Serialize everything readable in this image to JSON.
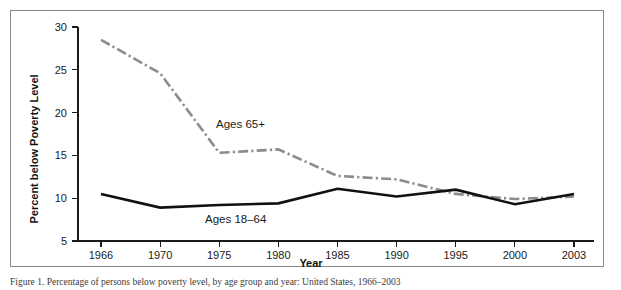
{
  "figure": {
    "background_color": "#ffffff",
    "border_color": "#8a8a8a",
    "caption_partial": "Figure 1. Percentage of persons below poverty level, by age group and year: United States, 1966–2003"
  },
  "chart_data": {
    "type": "line",
    "title": "",
    "xlabel": "Year",
    "ylabel": "Percent below Poverty Level",
    "categories": [
      "1966",
      "1970",
      "1975",
      "1980",
      "1985",
      "1990",
      "1995",
      "2000",
      "2003"
    ],
    "x": [
      1966,
      1970,
      1975,
      1980,
      1985,
      1990,
      1995,
      2000,
      2003
    ],
    "ylim": [
      5,
      30
    ],
    "yticks": [
      5,
      10,
      15,
      20,
      25,
      30
    ],
    "ytick_labels": [
      "5",
      "10",
      "15",
      "20",
      "25",
      "30"
    ],
    "grid": false,
    "legend": "inline-annotations",
    "series": [
      {
        "name": "Ages 65+",
        "color": "#8c8c8c",
        "style": "dash-dot",
        "label_text": "Ages 65+",
        "values": [
          28.5,
          24.6,
          15.3,
          15.7,
          12.6,
          12.2,
          10.5,
          9.9,
          10.2
        ]
      },
      {
        "name": "Ages 18–64",
        "color": "#111111",
        "style": "solid",
        "label_text": "Ages 18–64",
        "values": [
          10.5,
          8.9,
          9.2,
          9.4,
          11.1,
          10.2,
          11.0,
          9.3,
          10.5
        ]
      }
    ],
    "annotations": [
      {
        "text": "Ages 65+",
        "x_px": 215,
        "y_px": 127
      },
      {
        "text": "Ages 18–64",
        "x_px": 204,
        "y_px": 222
      }
    ]
  },
  "axes": {
    "x_axis_name": "year-axis",
    "y_axis_name": "percent-axis"
  }
}
